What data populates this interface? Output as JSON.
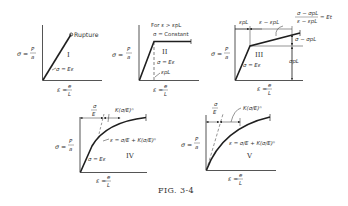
{
  "figure": {
    "caption": "FIG. 3-4",
    "panels": [
      {
        "id": "I",
        "roman": "I",
        "y_label": "σ = P/a",
        "x_label": "ε = e/L",
        "curve_label": "σ = Eε",
        "annotation": "Rupture"
      },
      {
        "id": "II",
        "roman": "II",
        "y_label": "σ = P/a",
        "x_label": "ε = e/L",
        "curve_label": "σ = Eε",
        "annotation_line1": "For ε > εpL",
        "annotation_line2": "σ = Constant",
        "marker_label": "εpL"
      },
      {
        "id": "III",
        "roman": "III",
        "y_label": "σ = P/a",
        "x_label": "ε = e/L",
        "curve_label": "σ = Eε",
        "dim_left": "εpL",
        "dim_right": "ε − εpL",
        "tangent_formula_num": "σ − σpL",
        "tangent_formula_den": "ε − εpL",
        "tangent_formula_result": "= Et",
        "upper_dim": "σ − σpL",
        "lower_dim": "σpL"
      },
      {
        "id": "IV",
        "roman": "IV",
        "y_label": "σ = P/a",
        "x_label": "ε = e/L",
        "curve_label": "σ = Eε",
        "dim_left": "σ/E",
        "dim_right": "K(σ/E)ⁿ",
        "equation": "ε = σ/E + K(σ/E)ⁿ"
      },
      {
        "id": "V",
        "roman": "V",
        "y_label": "σ = P/a",
        "x_label": "ε = e/L",
        "dim_left": "σ/E",
        "dim_right": "K(σ/E)ⁿ",
        "equation": "ε = σ/E + K(σ/E)ⁿ"
      }
    ]
  },
  "colors": {
    "ink": "#2a2a2a",
    "background": "#ffffff"
  }
}
